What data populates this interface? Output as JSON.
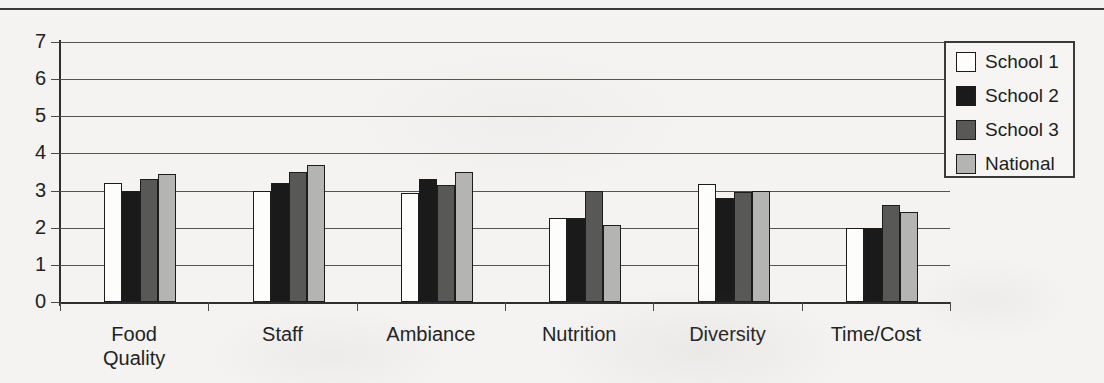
{
  "chart_data": {
    "type": "bar",
    "title": "",
    "subtitle": "",
    "xlabel": "",
    "ylabel": "",
    "ylim": [
      0,
      7
    ],
    "yticks": [
      0,
      1,
      2,
      3,
      4,
      5,
      6,
      7
    ],
    "ytick_labels": [
      "0",
      "1",
      "2",
      "3",
      "4",
      "5",
      "6",
      "7"
    ],
    "grid": true,
    "legend_position": "upper right",
    "categories": [
      "Food\nQuality",
      "Staff",
      "Ambiance",
      "Nutrition",
      "Diversity",
      "Time/Cost"
    ],
    "category_labels_flat": [
      "Food Quality",
      "Staff",
      "Ambiance",
      "Nutrition",
      "Diversity",
      "Time/Cost"
    ],
    "series": [
      {
        "name": "School 1",
        "color": "#ffffff",
        "values": [
          3.2,
          3.0,
          2.93,
          2.25,
          3.17,
          2.0
        ]
      },
      {
        "name": "School 2",
        "color": "#1a1a1a",
        "values": [
          3.0,
          3.2,
          3.3,
          2.25,
          2.8,
          2.0
        ]
      },
      {
        "name": "School 3",
        "color": "#585856",
        "values": [
          3.3,
          3.5,
          3.15,
          3.0,
          2.95,
          2.62
        ]
      },
      {
        "name": "National",
        "color": "#b4b4b2",
        "values": [
          3.45,
          3.7,
          3.5,
          2.07,
          3.0,
          2.43
        ]
      }
    ]
  },
  "legend": {
    "entries": [
      {
        "label": "School 1",
        "swatch": "white-square-swatch"
      },
      {
        "label": "School 2",
        "swatch": "black-square-swatch"
      },
      {
        "label": "School 3",
        "swatch": "dark-gray-square-swatch"
      },
      {
        "label": "National",
        "swatch": "light-gray-square-swatch"
      }
    ]
  },
  "colors": {
    "background": "#f4f3f1",
    "axis": "#2e2e2e",
    "grid": "#55544f",
    "text": "#222222",
    "series_1": "#ffffff",
    "series_2": "#1a1a1a",
    "series_3": "#585856",
    "series_4": "#b4b4b2"
  }
}
